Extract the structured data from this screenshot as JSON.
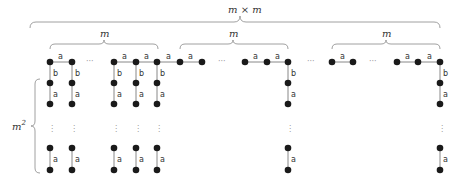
{
  "diagram": {
    "top_brace_label": "m × m",
    "group_brace_label": "m",
    "side_brace_label": "m",
    "side_brace_sup": "2",
    "edge_horizontal_label": "a",
    "edge_b_label": "b",
    "edge_vertical_label": "a",
    "hdots": "···",
    "vdots": "⋮",
    "colors": {
      "node": "#1a1a1a",
      "edge": "#888888",
      "text": "#333333"
    }
  }
}
